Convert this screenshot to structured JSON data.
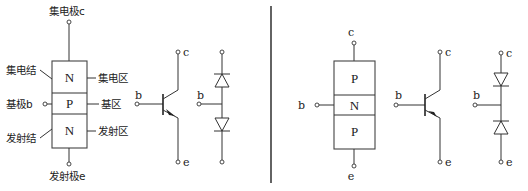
{
  "diagram": {
    "npn": {
      "structure": {
        "layers": [
          "N",
          "P",
          "N"
        ],
        "terminal_top": "集电极c",
        "terminal_base": "基极b",
        "terminal_bottom": "发射极e",
        "junction_top": "集电结",
        "junction_bottom": "发射结",
        "region_top": "集电区",
        "region_mid": "基区",
        "region_bottom": "发射区"
      },
      "symbol": {
        "collector": "c",
        "base": "b",
        "emitter": "e",
        "type": "NPN"
      },
      "diode_equivalent": {
        "base": "b",
        "description": "two diodes anode-to-anode at base"
      }
    },
    "divider": "vertical-line",
    "pnp": {
      "structure": {
        "layers": [
          "P",
          "N",
          "P"
        ],
        "terminal_top": "c",
        "terminal_base": "b",
        "terminal_bottom": "e"
      },
      "symbol": {
        "collector": "c",
        "base": "b",
        "emitter": "e",
        "type": "PNP"
      },
      "diode_equivalent": {
        "collector": "c",
        "base": "b",
        "emitter": "e",
        "description": "two diodes cathode-to-cathode at base"
      }
    }
  }
}
